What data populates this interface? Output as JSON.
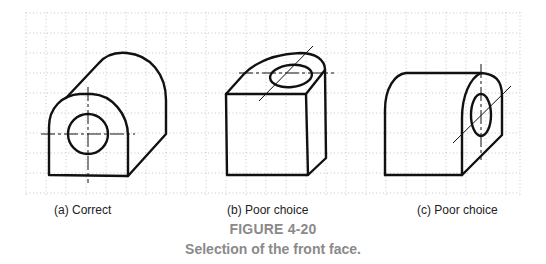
{
  "figure": {
    "number": "FIGURE 4-20",
    "title": "Selection of the front face.",
    "grid": {
      "color": "#b5b5b5",
      "spacing_px": 20,
      "style": "dotted"
    },
    "line_color": "#111111",
    "caption_color": "#8a8a8a",
    "panels": [
      {
        "id": "a",
        "caption": "(a) Correct",
        "description": "Isometric sketch of a rounded-top block with a through hole on the front face"
      },
      {
        "id": "b",
        "caption": "(b) Poor choice",
        "description": "Same object oriented so the hole appears on the top face"
      },
      {
        "id": "c",
        "caption": "(c) Poor choice",
        "description": "Same object oriented so the hole appears on the right side face"
      }
    ]
  }
}
